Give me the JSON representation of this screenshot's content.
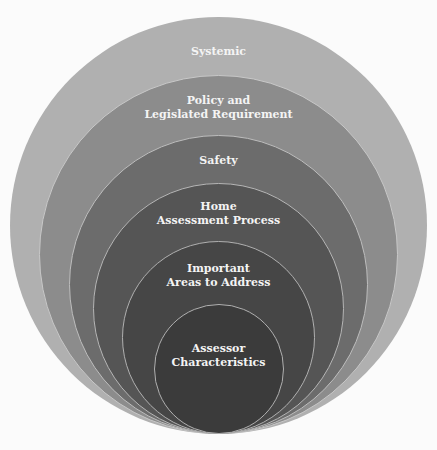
{
  "diagram": {
    "type": "nested-concentric-circles",
    "layers": [
      {
        "label_lines": [
          "Systemic"
        ],
        "color": "#b0b0b0"
      },
      {
        "label_lines": [
          "Policy and",
          "Legislated Requirement"
        ],
        "color": "#8c8c8c"
      },
      {
        "label_lines": [
          "Safety"
        ],
        "color": "#6c6c6c"
      },
      {
        "label_lines": [
          "Home",
          "Assessment Process"
        ],
        "color": "#555555"
      },
      {
        "label_lines": [
          "Important",
          "Areas to Address"
        ],
        "color": "#464646"
      },
      {
        "label_lines": [
          "Assessor",
          "Characteristics"
        ],
        "color": "#3b3b3b"
      }
    ]
  }
}
